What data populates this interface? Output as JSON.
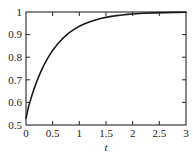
{
  "chart_data": {
    "type": "line",
    "title": "",
    "subtitle": "",
    "xlabel": "t",
    "ylabel": "",
    "xlim": [
      0,
      3
    ],
    "ylim": [
      0.5,
      1
    ],
    "grid": false,
    "legend": null,
    "x_ticks": [
      0,
      0.5,
      1,
      1.5,
      2,
      2.5,
      3
    ],
    "x_tick_labels": [
      "0",
      "0.5",
      "1",
      "1.5",
      "2",
      "2.5",
      "3"
    ],
    "y_ticks": [
      0.5,
      0.6,
      0.7,
      0.8,
      0.9,
      1
    ],
    "y_tick_labels": [
      "0.5",
      "0.6",
      "0.7",
      "0.8",
      "0.9",
      "1"
    ],
    "series": [
      {
        "name": "curve",
        "color": "#1a1a1a",
        "x": [
          0,
          0.05,
          0.1,
          0.15,
          0.2,
          0.25,
          0.3,
          0.35,
          0.4,
          0.45,
          0.5,
          0.6,
          0.7,
          0.8,
          0.9,
          1.0,
          1.1,
          1.2,
          1.3,
          1.4,
          1.5,
          1.6,
          1.7,
          1.8,
          1.9,
          2.0,
          2.2,
          2.4,
          2.6,
          2.8,
          3.0
        ],
        "y": [
          0.53,
          0.5836,
          0.6231,
          0.6588,
          0.6912,
          0.7205,
          0.747,
          0.771,
          0.7927,
          0.8123,
          0.8301,
          0.8607,
          0.8857,
          0.9062,
          0.923,
          0.9368,
          0.948,
          0.9572,
          0.9649,
          0.9712,
          0.9763,
          0.9806,
          0.9841,
          0.987,
          0.9893,
          0.9913,
          0.9942,
          0.9961,
          0.9974,
          0.9983,
          0.9988
        ]
      }
    ]
  },
  "axes": {
    "x_axis_label": "t",
    "frame": {
      "left_px": 26,
      "right_px": 186,
      "top_px": 12,
      "bottom_px": 125
    }
  }
}
